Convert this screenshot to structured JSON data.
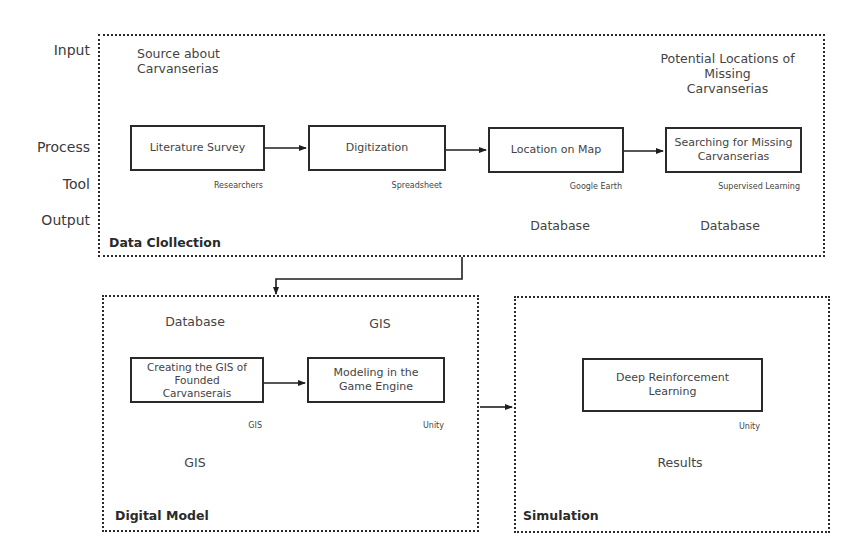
{
  "row_labels": {
    "input": "Input",
    "process": "Process",
    "tool": "Tool",
    "output": "Output"
  },
  "data_collection": {
    "title": "Data Clollection",
    "input_left": [
      "Source about",
      "Carvanserias"
    ],
    "input_right": [
      "Potential Locations of",
      "Missing",
      "Carvanserias"
    ],
    "steps": [
      {
        "label": [
          "Literature Survey"
        ],
        "tool": "Researchers"
      },
      {
        "label": [
          "Digitization"
        ],
        "tool": "Spreadsheet"
      },
      {
        "label": [
          "Location on Map"
        ],
        "tool": "Google Earth",
        "output": "Database"
      },
      {
        "label": [
          "Searching for Missing",
          "Carvanserias"
        ],
        "tool": "Supervised Learning",
        "output": "Database"
      }
    ]
  },
  "digital_model": {
    "title": "Digital Model",
    "input_left": "Database",
    "input_right": "GIS",
    "output": "GIS",
    "steps": [
      {
        "label": [
          "Creating the GIS of",
          "Founded",
          "Carvanserais"
        ],
        "tool": "GIS"
      },
      {
        "label": [
          "Modeling in the",
          "Game Engine"
        ],
        "tool": "Unity"
      }
    ]
  },
  "simulation": {
    "title": "Simulation",
    "steps": [
      {
        "label": [
          "Deep Reinforcement",
          "Learning"
        ],
        "tool": "Unity"
      }
    ],
    "output": "Results"
  }
}
